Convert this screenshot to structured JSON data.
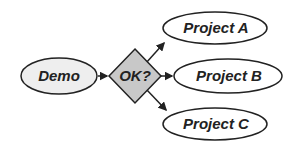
{
  "diagram": {
    "type": "flowchart",
    "nodes": [
      {
        "id": "demo",
        "label": "Demo",
        "shape": "ellipse",
        "fill": "#eeeeee"
      },
      {
        "id": "ok",
        "label": "OK?",
        "shape": "diamond",
        "fill": "#c8c8c8"
      },
      {
        "id": "projA",
        "label": "Project A",
        "shape": "ellipse",
        "fill": "#ffffff"
      },
      {
        "id": "projB",
        "label": "Project B",
        "shape": "ellipse",
        "fill": "#ffffff"
      },
      {
        "id": "projC",
        "label": "Project C",
        "shape": "ellipse",
        "fill": "#ffffff"
      }
    ],
    "edges": [
      {
        "from": "demo",
        "to": "ok"
      },
      {
        "from": "ok",
        "to": "projA"
      },
      {
        "from": "ok",
        "to": "projB"
      },
      {
        "from": "ok",
        "to": "projC"
      }
    ],
    "stroke_color": "#222222"
  }
}
